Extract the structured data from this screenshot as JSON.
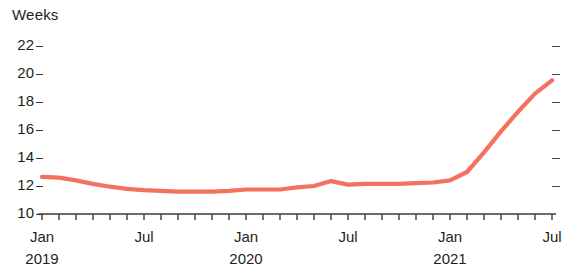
{
  "chart_data": {
    "type": "line",
    "title": "",
    "subtitle": "",
    "ylabel": "Weeks",
    "xlabel": "",
    "ylim": [
      10,
      22
    ],
    "yticks": [
      10,
      12,
      14,
      16,
      18,
      20,
      22
    ],
    "ytick_labels": [
      "10",
      "12",
      "14",
      "16",
      "18",
      "20",
      "22"
    ],
    "right_axis_ticks": [
      12,
      14,
      16,
      18,
      20,
      22
    ],
    "grid": false,
    "legend": null,
    "minor_tick_interval_months": 1,
    "x_axis_start": "2019-01",
    "x_axis_end": "2021-07",
    "xtick_labels": [
      {
        "label": "Jan",
        "year": "2019",
        "x": "2019-01"
      },
      {
        "label": "Jul",
        "year": "",
        "x": "2019-07"
      },
      {
        "label": "Jan",
        "year": "2020",
        "x": "2020-01"
      },
      {
        "label": "Jul",
        "year": "",
        "x": "2020-07"
      },
      {
        "label": "Jan",
        "year": "2021",
        "x": "2021-01"
      },
      {
        "label": "Jul",
        "year": "",
        "x": "2021-07"
      }
    ],
    "series": [
      {
        "name": "Weeks",
        "color": "#f4705f",
        "x": [
          "2019-01",
          "2019-02",
          "2019-03",
          "2019-04",
          "2019-05",
          "2019-06",
          "2019-07",
          "2019-08",
          "2019-09",
          "2019-10",
          "2019-11",
          "2019-12",
          "2020-01",
          "2020-02",
          "2020-03",
          "2020-04",
          "2020-05",
          "2020-06",
          "2020-07",
          "2020-08",
          "2020-09",
          "2020-10",
          "2020-11",
          "2020-12",
          "2021-01",
          "2021-02",
          "2021-03",
          "2021-04",
          "2021-05",
          "2021-06",
          "2021-07"
        ],
        "values": [
          12.65,
          12.6,
          12.4,
          12.15,
          11.95,
          11.8,
          11.7,
          11.65,
          11.6,
          11.6,
          11.6,
          11.65,
          11.75,
          11.75,
          11.75,
          11.9,
          12.0,
          12.35,
          12.1,
          12.15,
          12.15,
          12.15,
          12.2,
          12.25,
          12.4,
          13.0,
          14.4,
          15.9,
          17.3,
          18.6,
          19.55
        ]
      }
    ]
  }
}
